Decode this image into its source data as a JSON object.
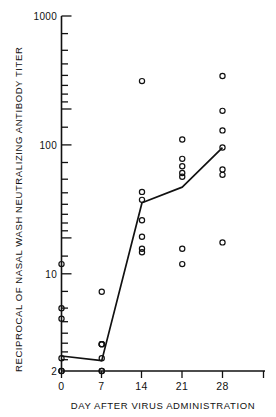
{
  "chart_data": {
    "type": "scatter",
    "title": "",
    "xlabel": "DAY AFTER VIRUS ADMINISTRATION",
    "ylabel": "RECIPROCAL OF NASAL WASH NEUTRALIZING ANTIBODY TITER",
    "yscale": "log",
    "ylim": [
      2,
      1000
    ],
    "xlim": [
      -1.5,
      33
    ],
    "grid": false,
    "legend": false,
    "ytick_labels": [
      "1000",
      "100",
      "10",
      "2"
    ],
    "ytick_values": [
      1000,
      100,
      10,
      2
    ],
    "xtick_labels": [
      "0",
      "7",
      "14",
      "21",
      "28"
    ],
    "xtick_values": [
      0,
      7,
      14,
      21,
      28
    ],
    "categories": [
      0,
      7,
      14,
      21,
      28
    ],
    "series": [
      {
        "name": "individual subject titers",
        "marker": "open-circle",
        "points": [
          {
            "x": 0,
            "y": 13
          },
          {
            "x": 0,
            "y": 6
          },
          {
            "x": 0,
            "y": 5
          },
          {
            "x": 0,
            "y": 2.5
          },
          {
            "x": 0,
            "y": 2
          },
          {
            "x": 0,
            "y": 2
          },
          {
            "x": 7,
            "y": 8
          },
          {
            "x": 7,
            "y": 3.2
          },
          {
            "x": 7,
            "y": 3.2
          },
          {
            "x": 7,
            "y": 3.2
          },
          {
            "x": 7,
            "y": 2.5
          },
          {
            "x": 7,
            "y": 2
          },
          {
            "x": 7,
            "y": 2
          },
          {
            "x": 14,
            "y": 320
          },
          {
            "x": 14,
            "y": 46
          },
          {
            "x": 14,
            "y": 40
          },
          {
            "x": 14,
            "y": 28
          },
          {
            "x": 14,
            "y": 21
          },
          {
            "x": 14,
            "y": 17
          },
          {
            "x": 14,
            "y": 16
          },
          {
            "x": 21,
            "y": 115
          },
          {
            "x": 21,
            "y": 82
          },
          {
            "x": 21,
            "y": 72
          },
          {
            "x": 21,
            "y": 64
          },
          {
            "x": 21,
            "y": 60
          },
          {
            "x": 21,
            "y": 17
          },
          {
            "x": 21,
            "y": 13
          },
          {
            "x": 28,
            "y": 350
          },
          {
            "x": 28,
            "y": 190
          },
          {
            "x": 28,
            "y": 135
          },
          {
            "x": 28,
            "y": 100
          },
          {
            "x": 28,
            "y": 68
          },
          {
            "x": 28,
            "y": 62
          },
          {
            "x": 28,
            "y": 19
          }
        ]
      },
      {
        "name": "geometric mean titer",
        "marker": "line",
        "values": [
          2.6,
          2.4,
          38,
          50,
          100
        ],
        "x": [
          0,
          7,
          14,
          21,
          28
        ]
      }
    ]
  },
  "axes": {
    "y_title": "RECIPROCAL OF NASAL WASH NEUTRALIZING ANTIBODY TITER",
    "x_title": "DAY AFTER VIRUS ADMINISTRATION"
  }
}
